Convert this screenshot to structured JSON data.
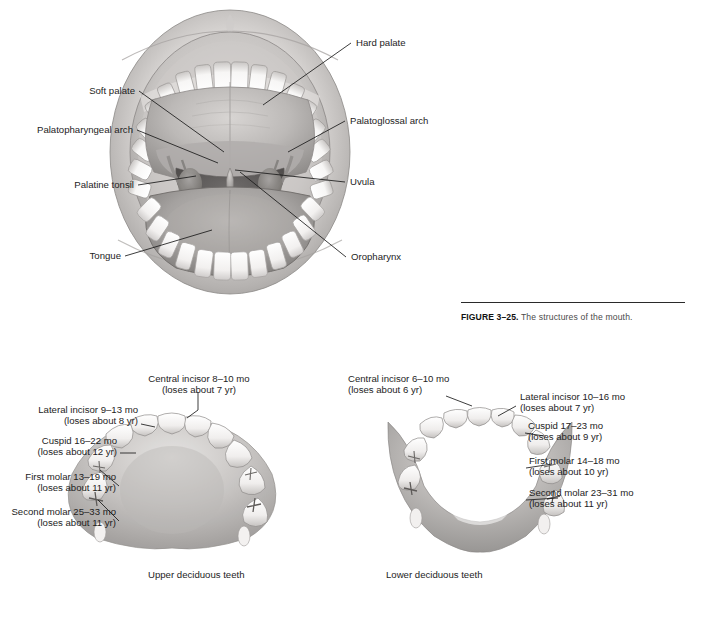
{
  "figure": {
    "number": "FIGURE 3–25.",
    "caption": " The structures of the mouth."
  },
  "mouth_diagram": {
    "labels": {
      "hard_palate": "Hard palate",
      "soft_palate": "Soft palate",
      "palatopharyngeal_arch": "Palatopharyngeal arch",
      "palatoglossal_arch": "Palatoglossal arch",
      "palatine_tonsil": "Palatine tonsil",
      "uvula": "Uvula",
      "tongue": "Tongue",
      "oropharynx": "Oropharynx"
    }
  },
  "upper_teeth": {
    "caption": "Upper deciduous teeth",
    "labels": [
      {
        "name": "Central incisor 8–10 mo",
        "loses": "(loses about 7 yr)"
      },
      {
        "name": "Lateral incisor 9–13 mo",
        "loses": "(loses about 8 yr)"
      },
      {
        "name": "Cuspid 16–22 mo",
        "loses": "(loses about 12 yr)"
      },
      {
        "name": "First molar 13–19 mo",
        "loses": "(loses about 11 yr)"
      },
      {
        "name": "Second molar 25–33 mo",
        "loses": "(loses about 11 yr)"
      }
    ]
  },
  "lower_teeth": {
    "caption": "Lower deciduous teeth",
    "labels": [
      {
        "name": "Central incisor 6–10 mo",
        "loses": "(loses about 6 yr)"
      },
      {
        "name": "Lateral incisor 10–16 mo",
        "loses": "(loses about 7 yr)"
      },
      {
        "name": "Cuspid 17–23 mo",
        "loses": "(loses about 9 yr)"
      },
      {
        "name": "First molar 14–18 mo",
        "loses": "(loses about 10 yr)"
      },
      {
        "name": "Second molar 23–31 mo",
        "loses": "(loses about 11 yr)"
      }
    ]
  },
  "colors": {
    "background": "#ffffff",
    "ink": "#1a1a1a",
    "caption_gray": "#4a4a4a",
    "tissue_light": "#e9e7e6",
    "tissue_mid": "#b9b6b4",
    "tissue_dark": "#7d7a79",
    "cavity_dark": "#6f6c6b",
    "tooth_white": "#fbfbfa"
  }
}
